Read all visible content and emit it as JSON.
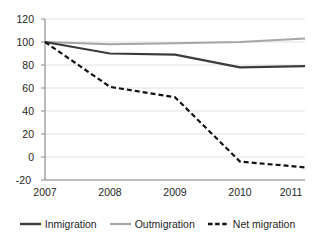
{
  "chart_data": {
    "type": "line",
    "title": "",
    "subtitle": "",
    "xlabel": "",
    "ylabel": "",
    "categories": [
      "2007",
      "2008",
      "2009",
      "2010",
      "2011"
    ],
    "x": [
      2007,
      2008,
      2009,
      2010,
      2011
    ],
    "xlim": [
      2007,
      2011
    ],
    "ylim": [
      -20,
      120
    ],
    "yticks": [
      -20,
      0,
      20,
      40,
      60,
      80,
      100,
      120
    ],
    "xticks": [
      "2007",
      "2008",
      "2009",
      "2010",
      "2011"
    ],
    "grid": "horizontal",
    "legend_position": "bottom",
    "series": [
      {
        "name": "Inmigration",
        "values": [
          100,
          90,
          89,
          78,
          79
        ],
        "color": "#3b3b3b",
        "style": "solid",
        "width": 2.2
      },
      {
        "name": "Outmigration",
        "values": [
          100,
          98,
          99,
          100,
          103
        ],
        "color": "#a6a6a6",
        "style": "solid",
        "width": 2.0
      },
      {
        "name": "Net migration",
        "values": [
          100,
          61,
          52,
          -4,
          -9
        ],
        "color": "#121212",
        "style": "dashed",
        "width": 2.2
      }
    ]
  },
  "axis": {
    "y_tick_labels": [
      "120",
      "100",
      "80",
      "60",
      "40",
      "20",
      "0",
      "-20"
    ],
    "x_tick_labels": [
      "2007",
      "2008",
      "2009",
      "2010",
      "2011"
    ]
  },
  "legend": {
    "items": [
      {
        "label": "Inmigration",
        "color": "#3b3b3b",
        "style": "solid"
      },
      {
        "label": "Outmigration",
        "color": "#a6a6a6",
        "style": "solid"
      },
      {
        "label": "Net migration",
        "color": "#121212",
        "style": "dashed"
      }
    ]
  },
  "colors": {
    "background": "#ffffff",
    "grid": "#d9d9d9",
    "axis": "#808080",
    "text": "#262626"
  }
}
